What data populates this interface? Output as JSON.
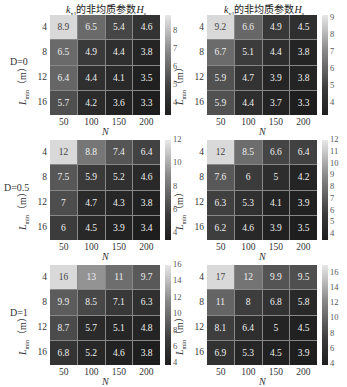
{
  "chart_data": [
    {
      "type": "heatmap",
      "title": "k_x1 的非均质参数H_s",
      "row_label": "D=0",
      "xlabel": "N",
      "ylabel": "L_min (m)",
      "x_categories": [
        "50",
        "100",
        "150",
        "200"
      ],
      "y_categories": [
        "4",
        "8",
        "12",
        "16"
      ],
      "values": [
        [
          8.9,
          6.5,
          5.4,
          4.6
        ],
        [
          6.5,
          4.9,
          4.4,
          3.8
        ],
        [
          6.4,
          4.4,
          4.1,
          3.5
        ],
        [
          5.7,
          4.2,
          3.6,
          3.3
        ]
      ],
      "colorbar_ticks": [
        "8",
        "7",
        "6",
        "5",
        "4"
      ],
      "colorbar_range": [
        3.3,
        8.9
      ]
    },
    {
      "type": "heatmap",
      "title": "k_y1 的非均质参数H_s",
      "row_label": "D=0",
      "xlabel": "N",
      "ylabel": "L_min (m)",
      "x_categories": [
        "50",
        "100",
        "150",
        "200"
      ],
      "y_categories": [
        "4",
        "8",
        "12",
        "16"
      ],
      "values": [
        [
          9.2,
          6.6,
          4.9,
          4.5
        ],
        [
          6.7,
          5.1,
          4.4,
          3.8
        ],
        [
          5.9,
          4.7,
          3.9,
          3.8
        ],
        [
          5.9,
          4.4,
          3.7,
          3.3
        ]
      ],
      "colorbar_ticks": [
        "9",
        "8",
        "7",
        "6",
        "5",
        "4"
      ],
      "colorbar_range": [
        3.3,
        9.2
      ]
    },
    {
      "type": "heatmap",
      "title": "",
      "row_label": "D=0.5",
      "xlabel": "N",
      "ylabel": "L_min (m)",
      "x_categories": [
        "50",
        "100",
        "150",
        "200"
      ],
      "y_categories": [
        "4",
        "8",
        "12",
        "16"
      ],
      "values": [
        [
          12,
          8.8,
          7.4,
          6.4
        ],
        [
          7.5,
          5.9,
          5.2,
          4.6
        ],
        [
          7,
          4.7,
          4.3,
          3.8
        ],
        [
          6,
          4.5,
          3.9,
          3.4
        ]
      ],
      "colorbar_ticks": [
        "12",
        "10",
        "8",
        "6",
        "4"
      ],
      "colorbar_range": [
        3.4,
        12
      ]
    },
    {
      "type": "heatmap",
      "title": "",
      "row_label": "D=0.5",
      "xlabel": "N",
      "ylabel": "L_min (m)",
      "x_categories": [
        "50",
        "100",
        "150",
        "200"
      ],
      "y_categories": [
        "4",
        "8",
        "12",
        "16"
      ],
      "values": [
        [
          12,
          8.5,
          6.6,
          6.4
        ],
        [
          7.6,
          6,
          5,
          4.2
        ],
        [
          6.3,
          5.3,
          4.1,
          3.9
        ],
        [
          6.2,
          4.6,
          3.9,
          3.5
        ]
      ],
      "colorbar_ticks": [
        "12",
        "11",
        "10",
        "9",
        "8",
        "7",
        "6",
        "5",
        "4"
      ],
      "colorbar_range": [
        3.5,
        12
      ]
    },
    {
      "type": "heatmap",
      "title": "",
      "row_label": "D=1",
      "xlabel": "N",
      "ylabel": "L_min (m)",
      "x_categories": [
        "50",
        "100",
        "150",
        "200"
      ],
      "y_categories": [
        "4",
        "8",
        "12",
        "16"
      ],
      "values": [
        [
          16,
          13,
          11,
          9.7
        ],
        [
          9.9,
          8.5,
          7.1,
          6.3
        ],
        [
          8.7,
          5.7,
          5.1,
          4.8
        ],
        [
          6.8,
          5.2,
          4.6,
          3.8
        ]
      ],
      "colorbar_ticks": [
        "16",
        "14",
        "12",
        "10",
        "8",
        "6",
        "4"
      ],
      "colorbar_range": [
        3.8,
        16
      ]
    },
    {
      "type": "heatmap",
      "title": "",
      "row_label": "D=1",
      "xlabel": "N",
      "ylabel": "L_min (m)",
      "x_categories": [
        "50",
        "100",
        "150",
        "200"
      ],
      "y_categories": [
        "4",
        "8",
        "12",
        "16"
      ],
      "values": [
        [
          17,
          12,
          9.9,
          9.5
        ],
        [
          11,
          8,
          6.8,
          5.8
        ],
        [
          8.1,
          6.4,
          5,
          4.5
        ],
        [
          6.9,
          5.3,
          4.5,
          3.9
        ]
      ],
      "colorbar_ticks": [
        "16",
        "14",
        "12",
        "10",
        "8",
        "6",
        "4"
      ],
      "colorbar_range": [
        3.9,
        17
      ]
    }
  ],
  "labels": {
    "title_left_k": "k",
    "title_left_sub": "x1",
    "title_right_k": "k",
    "title_right_sub": "y1",
    "title_mid": "的非均质参数",
    "title_H": "H",
    "title_H_sub": "s",
    "ylabel_L": "L",
    "ylabel_sub": "min",
    "ylabel_unit": "（m）",
    "row0": "D=0",
    "row1": "D=0.5",
    "row2": "D=1",
    "xlabel": "N"
  }
}
